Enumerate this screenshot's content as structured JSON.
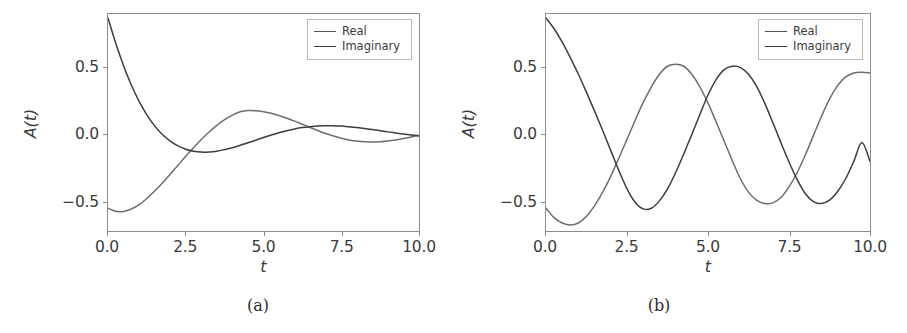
{
  "figure": {
    "background": "#ffffff",
    "line_color_real": "#6e6e6e",
    "line_color_imaginary": "#3d3d3d",
    "axis_color": "#8c8c8c"
  },
  "panels": [
    {
      "id": "a",
      "subcaption": "(a)",
      "xlabel": "t",
      "ylabel": "A(t)",
      "xticks": [
        "0.0",
        "2.5",
        "5.0",
        "7.5",
        "10.0"
      ],
      "yticks": [
        "0.5",
        "0.0",
        "−0.5"
      ],
      "legend": [
        {
          "label": "Real"
        },
        {
          "label": "Imaginary"
        }
      ]
    },
    {
      "id": "b",
      "subcaption": "(b)",
      "xlabel": "t",
      "ylabel": "A(t)",
      "xticks": [
        "0.0",
        "2.5",
        "5.0",
        "7.5",
        "10.0"
      ],
      "yticks": [
        "0.5",
        "0.0",
        "−0.5"
      ],
      "legend": [
        {
          "label": "Real"
        },
        {
          "label": "Imaginary"
        }
      ]
    }
  ],
  "chart_data": [
    {
      "type": "line",
      "panel": "a",
      "title": "",
      "xlabel": "t",
      "ylabel": "A(t)",
      "xlim": [
        0,
        10
      ],
      "ylim": [
        -0.72,
        0.9
      ],
      "grid": false,
      "legend_position": "upper right",
      "xticks": [
        0.0,
        2.5,
        5.0,
        7.5,
        10.0
      ],
      "yticks": [
        -0.5,
        0.0,
        0.5
      ],
      "x": [
        0.0,
        0.25,
        0.5,
        0.75,
        1.0,
        1.25,
        1.5,
        1.75,
        2.0,
        2.25,
        2.5,
        2.75,
        3.0,
        3.25,
        3.5,
        3.75,
        4.0,
        4.25,
        4.5,
        4.75,
        5.0,
        5.25,
        5.5,
        5.75,
        6.0,
        6.25,
        6.5,
        6.75,
        7.0,
        7.25,
        7.5,
        7.75,
        8.0,
        8.25,
        8.5,
        8.75,
        9.0,
        9.25,
        9.5,
        9.75,
        10.0
      ],
      "series": [
        {
          "name": "Real",
          "values": [
            -0.55,
            -0.573,
            -0.574,
            -0.556,
            -0.523,
            -0.477,
            -0.422,
            -0.361,
            -0.296,
            -0.229,
            -0.162,
            -0.098,
            -0.037,
            0.019,
            0.069,
            0.111,
            0.145,
            0.17,
            0.179,
            0.178,
            0.171,
            0.159,
            0.142,
            0.122,
            0.1,
            0.077,
            0.053,
            0.03,
            0.008,
            -0.011,
            -0.027,
            -0.04,
            -0.049,
            -0.054,
            -0.055,
            -0.053,
            -0.048,
            -0.04,
            -0.03,
            -0.018,
            -0.005
          ]
        },
        {
          "name": "Imaginary",
          "values": [
            0.87,
            0.681,
            0.514,
            0.37,
            0.248,
            0.147,
            0.065,
            0.0,
            -0.049,
            -0.085,
            -0.11,
            -0.125,
            -0.131,
            -0.13,
            -0.124,
            -0.112,
            -0.098,
            -0.08,
            -0.061,
            -0.042,
            -0.022,
            -0.003,
            0.014,
            0.029,
            0.042,
            0.052,
            0.059,
            0.064,
            0.066,
            0.065,
            0.063,
            0.058,
            0.052,
            0.045,
            0.037,
            0.029,
            0.02,
            0.012,
            0.004,
            -0.003,
            -0.01
          ]
        }
      ]
    },
    {
      "type": "line",
      "panel": "b",
      "title": "",
      "xlabel": "t",
      "ylabel": "A(t)",
      "xlim": [
        0,
        10
      ],
      "ylim": [
        -0.72,
        0.9
      ],
      "grid": false,
      "legend_position": "upper right",
      "xticks": [
        0.0,
        2.5,
        5.0,
        7.5,
        10.0
      ],
      "yticks": [
        -0.5,
        0.0,
        0.5
      ],
      "x": [
        0.0,
        0.25,
        0.5,
        0.75,
        1.0,
        1.25,
        1.5,
        1.75,
        2.0,
        2.25,
        2.5,
        2.75,
        3.0,
        3.25,
        3.5,
        3.75,
        4.0,
        4.25,
        4.5,
        4.75,
        5.0,
        5.25,
        5.5,
        5.75,
        6.0,
        6.25,
        6.5,
        6.75,
        7.0,
        7.25,
        7.5,
        7.75,
        8.0,
        8.25,
        8.5,
        8.75,
        9.0,
        9.25,
        9.5,
        9.75,
        10.0
      ],
      "series": [
        {
          "name": "Real",
          "values": [
            -0.55,
            -0.62,
            -0.66,
            -0.675,
            -0.66,
            -0.61,
            -0.53,
            -0.43,
            -0.31,
            -0.175,
            -0.035,
            0.105,
            0.24,
            0.355,
            0.45,
            0.51,
            0.525,
            0.51,
            0.45,
            0.355,
            0.235,
            0.095,
            -0.05,
            -0.195,
            -0.33,
            -0.43,
            -0.49,
            -0.515,
            -0.51,
            -0.47,
            -0.39,
            -0.285,
            -0.155,
            -0.01,
            0.135,
            0.265,
            0.365,
            0.43,
            0.46,
            0.465,
            0.46
          ]
        },
        {
          "name": "Imaginary",
          "values": [
            0.87,
            0.79,
            0.69,
            0.575,
            0.45,
            0.315,
            0.175,
            0.03,
            -0.12,
            -0.27,
            -0.405,
            -0.505,
            -0.555,
            -0.55,
            -0.495,
            -0.405,
            -0.285,
            -0.145,
            0.0,
            0.15,
            0.295,
            0.41,
            0.485,
            0.51,
            0.5,
            0.45,
            0.36,
            0.235,
            0.09,
            -0.06,
            -0.205,
            -0.335,
            -0.44,
            -0.5,
            -0.515,
            -0.49,
            -0.425,
            -0.33,
            -0.2,
            -0.06,
            -0.2
          ]
        }
      ]
    }
  ]
}
